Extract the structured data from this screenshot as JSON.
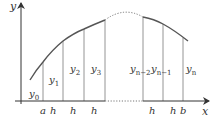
{
  "diagram": {
    "type": "trapezoidal-rule-area-diagram",
    "axes": {
      "y_label": "y",
      "x_label": "x"
    },
    "ordinates": [
      {
        "base": "y",
        "sub": "0"
      },
      {
        "base": "y",
        "sub": "1"
      },
      {
        "base": "y",
        "sub": "2"
      },
      {
        "base": "y",
        "sub": "3"
      },
      {
        "base": "y",
        "sub": "n−2"
      },
      {
        "base": "y",
        "sub": "n−1"
      },
      {
        "base": "y",
        "sub": "n"
      }
    ],
    "x_tick_labels": [
      "a",
      "h",
      "h",
      "h",
      "h",
      "h",
      "b"
    ],
    "colors": {
      "axis": "#333333",
      "curve": "#555555",
      "ordinate_lines": "#888888",
      "dotted": "#777777",
      "text": "#333333"
    }
  }
}
